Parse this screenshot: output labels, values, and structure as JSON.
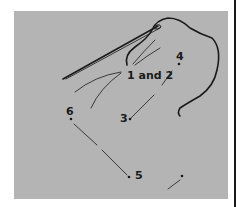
{
  "figure": {
    "colors": {
      "background": "#ffffff",
      "panel": "#b4b4b4",
      "ink": "#1a1a1a"
    },
    "labels": {
      "points_1_2": "1 and 2",
      "point_3": "3",
      "point_4": "4",
      "point_5": "5",
      "point_6": "6"
    }
  }
}
